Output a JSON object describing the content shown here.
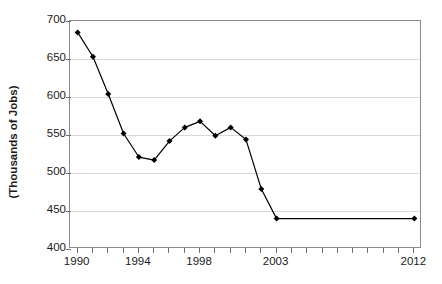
{
  "chart_data": {
    "type": "line",
    "title": "",
    "subtitle": "",
    "xlabel": "",
    "ylabel": "(Thousands of Jobs)",
    "grid": "horizontal",
    "legend": "none",
    "marker": "filled-diamond",
    "line_color": "#000000",
    "marker_color": "#000000",
    "gridline_color": "#d9d9d9",
    "axis_color": "#8a8a8a",
    "plot_background": "#ffffff",
    "xlim": [
      "1990",
      "2012"
    ],
    "ylim": [
      400,
      700
    ],
    "y_ticks": [
      400,
      450,
      500,
      550,
      600,
      650,
      700
    ],
    "y_tick_labels": [
      "400",
      "450",
      "500",
      "550",
      "600",
      "650",
      "700"
    ],
    "x_categories": [
      "1990",
      "1991",
      "1992",
      "1993",
      "1994",
      "1995",
      "1996",
      "1997",
      "1998",
      "1999",
      "2000",
      "2001",
      "2002",
      "2003",
      "2004",
      "2005",
      "2006",
      "2007",
      "2008",
      "2009",
      "2010",
      "2011",
      "2012"
    ],
    "x_tick_labels_shown": [
      "1990",
      "1994",
      "1998",
      "2003",
      "2012"
    ],
    "x_tick_label_indices": [
      0,
      4,
      8,
      13,
      22
    ],
    "values": [
      685,
      653,
      604,
      552,
      521,
      517,
      542,
      560,
      568,
      549,
      560,
      544,
      479,
      440,
      null,
      null,
      null,
      null,
      null,
      null,
      null,
      null,
      440
    ],
    "series": [
      {
        "name": "Jobs",
        "points": [
          {
            "x": "1990",
            "y": 685
          },
          {
            "x": "1991",
            "y": 653
          },
          {
            "x": "1992",
            "y": 604
          },
          {
            "x": "1993",
            "y": 552
          },
          {
            "x": "1994",
            "y": 521
          },
          {
            "x": "1995",
            "y": 517
          },
          {
            "x": "1996",
            "y": 542
          },
          {
            "x": "1997",
            "y": 560
          },
          {
            "x": "1998",
            "y": 568
          },
          {
            "x": "1999",
            "y": 549
          },
          {
            "x": "2000",
            "y": 560
          },
          {
            "x": "2001",
            "y": 544
          },
          {
            "x": "2002",
            "y": 479
          },
          {
            "x": "2003",
            "y": 440
          },
          {
            "x": "2012",
            "y": 440
          }
        ]
      }
    ],
    "annotations": []
  }
}
